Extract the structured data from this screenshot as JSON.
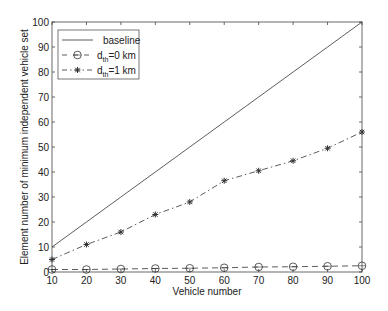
{
  "chart_data": {
    "type": "line",
    "title": "",
    "xlabel": "Vehicle number",
    "ylabel": "Element number of minimum independent vehicle set",
    "xlim": [
      10,
      100
    ],
    "ylim": [
      0,
      100
    ],
    "grid": false,
    "legend_position": "upper left",
    "x": [
      10,
      20,
      30,
      40,
      50,
      60,
      70,
      80,
      90,
      100
    ],
    "xticks": [
      10,
      20,
      30,
      40,
      50,
      60,
      70,
      80,
      90,
      100
    ],
    "yticks": [
      0,
      10,
      20,
      30,
      40,
      50,
      60,
      70,
      80,
      90,
      100
    ],
    "series": [
      {
        "name": "baseline",
        "legend_main": "baseline",
        "legend_sub": "",
        "legend_tail": "",
        "style": "solid",
        "marker": "none",
        "values": [
          10,
          20,
          30,
          40,
          50,
          60,
          70,
          80,
          90,
          100
        ]
      },
      {
        "name": "d_th=0 km",
        "legend_main": "d",
        "legend_sub": "th",
        "legend_tail": "=0 km",
        "style": "dashed",
        "marker": "circle",
        "values": [
          1,
          1,
          1.2,
          1.4,
          1.5,
          1.7,
          2,
          2.1,
          2.3,
          2.5
        ]
      },
      {
        "name": "d_th=1 km",
        "legend_main": "d",
        "legend_sub": "th",
        "legend_tail": "=1 km",
        "style": "dashdot",
        "marker": "star",
        "values": [
          5,
          11,
          16,
          23,
          28,
          36.5,
          40.5,
          44.5,
          49.5,
          56
        ]
      }
    ]
  },
  "colors": {
    "line": "#333333",
    "axis": "#444444",
    "legend_border": "#555555"
  }
}
